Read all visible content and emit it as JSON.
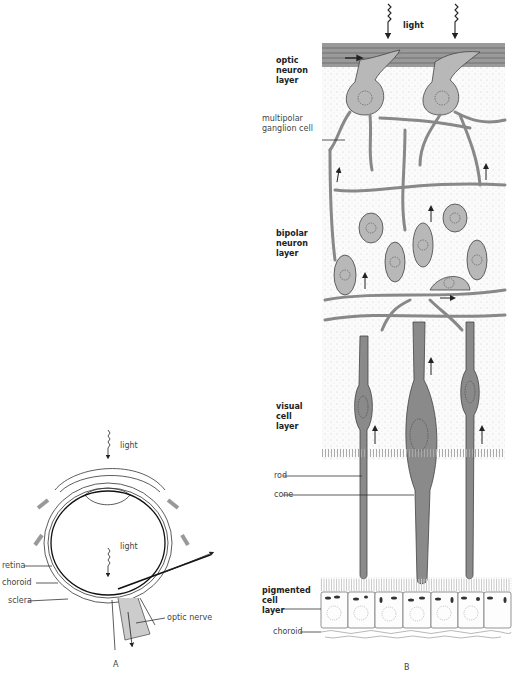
{
  "panel_a": {
    "letter": "A",
    "labels": {
      "light_top": "light",
      "light_inner": "light",
      "retina": "retina",
      "choroid": "choroid",
      "sclera": "sclera",
      "optic_nerve": "optic nerve"
    }
  },
  "panel_b": {
    "letter": "B",
    "labels": {
      "light": "light",
      "optic_neuron_layer": [
        "optic",
        "neuron",
        "layer"
      ],
      "multipolar_ganglion_cell": [
        "multipolar",
        "ganglion cell"
      ],
      "bipolar_neuron_layer": [
        "bipolar",
        "neuron",
        "layer"
      ],
      "visual_cell_layer": [
        "visual",
        "cell",
        "layer"
      ],
      "rod": "rod",
      "cone": "cone",
      "pigmented_cell_layer": [
        "pigmented",
        "cell",
        "layer"
      ],
      "choroid": "choroid"
    }
  },
  "colors": {
    "tissue_gray": "#b8b8b8",
    "optic_band": "#9a9a9a",
    "rod_dark": "#7a7a7a",
    "stipple_bg": "#f4f4f4",
    "line": "#333333"
  }
}
